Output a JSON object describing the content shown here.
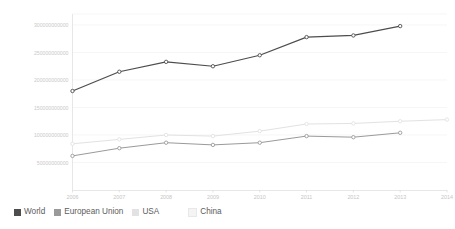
{
  "chart_data": {
    "type": "line",
    "title": "",
    "xlabel": "",
    "ylabel": "",
    "categories": [
      "2006",
      "2007",
      "2008",
      "2009",
      "2010",
      "2011",
      "2012",
      "2013",
      "2014"
    ],
    "x": [
      2006,
      2007,
      2008,
      2009,
      2010,
      2011,
      2012,
      2013,
      2014
    ],
    "xlim": [
      2006,
      2014
    ],
    "ylim": [
      0,
      320000000000
    ],
    "grid": true,
    "legend_position": "bottom-left",
    "ytick_labels": [
      "50000000000",
      "100000000000",
      "150000000000",
      "200000000000",
      "250000000000",
      "300000000000"
    ],
    "ytick_values": [
      50000000000,
      100000000000,
      150000000000,
      200000000000,
      250000000000,
      300000000000
    ],
    "series": [
      {
        "name": "World",
        "color": "#4d4d4d",
        "values": [
          180000000000,
          215000000000,
          233000000000,
          225000000000,
          245000000000,
          278000000000,
          281000000000,
          298000000000,
          null
        ]
      },
      {
        "name": "European Union",
        "color": "#9a9a9a",
        "values": [
          62000000000,
          76000000000,
          86000000000,
          82000000000,
          86000000000,
          98000000000,
          96000000000,
          104000000000,
          null
        ]
      },
      {
        "name": "USA",
        "color": "#e2e2e2",
        "values": [
          84000000000,
          92000000000,
          100000000000,
          98000000000,
          107000000000,
          120000000000,
          121000000000,
          125000000000,
          128000000000
        ]
      },
      {
        "name": "China",
        "color": "#f2f2f2",
        "values": [
          null,
          null,
          null,
          null,
          null,
          null,
          null,
          null,
          null
        ]
      }
    ]
  },
  "legend": {
    "items": [
      {
        "label": "World",
        "color": "#4d4d4d"
      },
      {
        "label": "European Union",
        "color": "#9a9a9a"
      },
      {
        "label": "USA",
        "color": "#e2e2e2"
      },
      {
        "label": "China",
        "color": "#f2f2f2"
      }
    ]
  },
  "colors": {
    "background": "#ffffff",
    "grid": "#f0f0f0",
    "axis": "#dcdcdc",
    "tick_text": "#c6c6c6",
    "legend_text": "#5c5c5c"
  }
}
